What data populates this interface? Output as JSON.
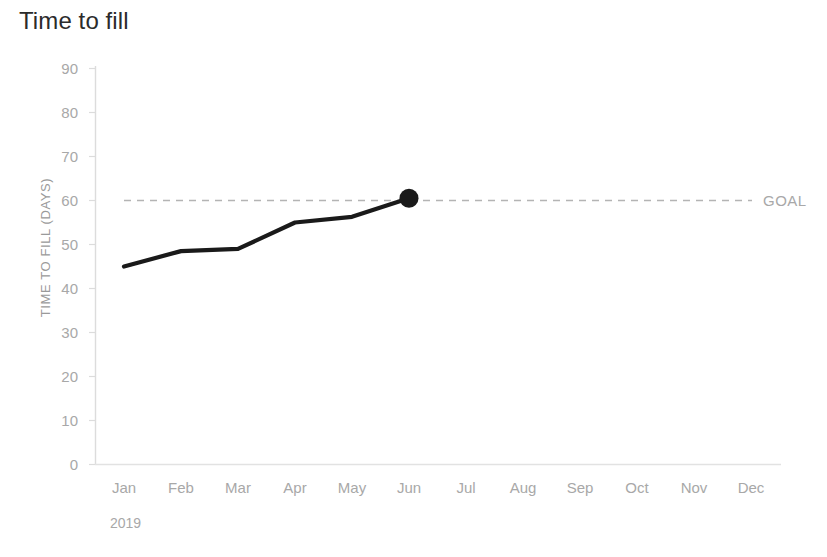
{
  "chart_data": {
    "type": "line",
    "title": "Time to fill",
    "xlabel": "",
    "ylabel": "TIME TO FILL (DAYS)",
    "period_label": "2019",
    "categories": [
      "Jan",
      "Feb",
      "Mar",
      "Apr",
      "May",
      "Jun",
      "Jul",
      "Aug",
      "Sep",
      "Oct",
      "Nov",
      "Dec"
    ],
    "y_ticks": [
      "0",
      "10",
      "20",
      "30",
      "40",
      "50",
      "60",
      "70",
      "80",
      "90"
    ],
    "ylim": [
      0,
      90
    ],
    "grid": false,
    "legend": "none",
    "series": [
      {
        "name": "Time to fill",
        "values": [
          45,
          48.5,
          49,
          55,
          56.3,
          60.5,
          null,
          null,
          null,
          null,
          null,
          null
        ],
        "color": "#1a1a1a",
        "marker_at": "Jun",
        "marker_value": 60.5
      }
    ],
    "reference_line": {
      "label": "GOAL",
      "value": 60,
      "style": "dashed",
      "color": "#b4b4b4"
    },
    "axis_color": "#dcdcdc",
    "tick_label_color": "#a8a8a8",
    "line_color": "#1a1a1a",
    "background": "#ffffff"
  }
}
